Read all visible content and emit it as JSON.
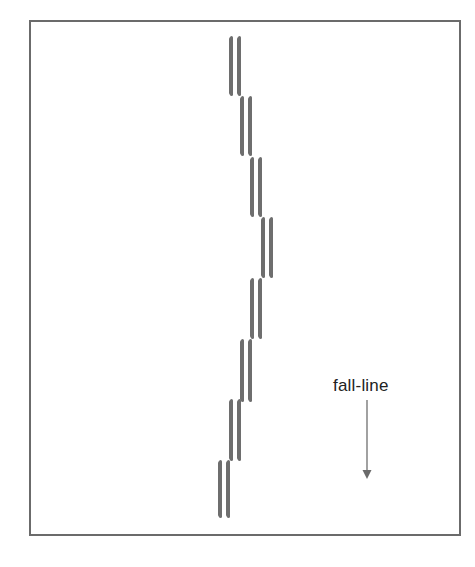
{
  "diagram": {
    "type": "ski-track-illustration",
    "frame": {
      "border_color": "#6b6b6b"
    },
    "ski_color": "#6e6e6e",
    "ski_pairs": [
      {
        "left_x": 229,
        "top_y": 37,
        "length": 58
      },
      {
        "left_x": 240,
        "top_y": 97,
        "length": 58
      },
      {
        "left_x": 250,
        "top_y": 158,
        "length": 58
      },
      {
        "left_x": 261,
        "top_y": 218,
        "length": 59
      },
      {
        "left_x": 250,
        "top_y": 279,
        "length": 59
      },
      {
        "left_x": 240,
        "top_y": 340,
        "length": 61
      },
      {
        "left_x": 229,
        "top_y": 400,
        "length": 60
      },
      {
        "left_x": 218,
        "top_y": 461,
        "length": 56
      }
    ],
    "ski_spacing": 8,
    "fall_line": {
      "label": "fall-line",
      "arrow_icon": "down-arrow-icon",
      "arrow_color": "#7a7a7a",
      "direction": "down"
    }
  }
}
